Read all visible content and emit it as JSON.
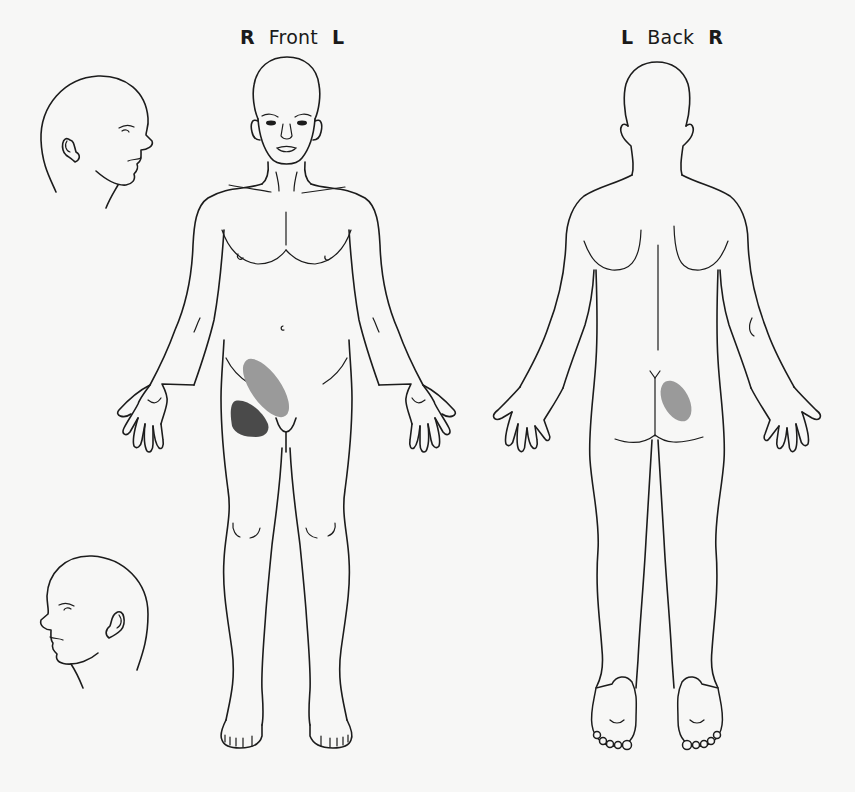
{
  "diagram": {
    "type": "body pain diagram",
    "views": [
      {
        "id": "front",
        "label": "Front",
        "left_side_marker": "R",
        "right_side_marker": "L"
      },
      {
        "id": "back",
        "label": "Back",
        "left_side_marker": "L",
        "right_side_marker": "R"
      }
    ],
    "head_profiles": [
      {
        "id": "head-right-profile",
        "facing": "right"
      },
      {
        "id": "head-left-profile",
        "facing": "left"
      }
    ],
    "pain_regions": [
      {
        "view": "front",
        "location": "right lower abdomen / iliac fossa",
        "shade": "light",
        "color": "#9a9a9a"
      },
      {
        "view": "front",
        "location": "right upper thigh / groin",
        "shade": "dark",
        "color": "#4a4a4a"
      },
      {
        "view": "back",
        "location": "right upper buttock",
        "shade": "light",
        "color": "#9a9a9a"
      }
    ]
  },
  "colors": {
    "background": "#f7f7f6",
    "outline": "#1c1c1c",
    "pain_light": "#9a9a9a",
    "pain_dark": "#4a4a4a"
  }
}
